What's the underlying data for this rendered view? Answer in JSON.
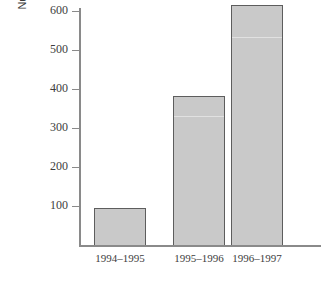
{
  "chart_data": {
    "type": "bar",
    "title": "",
    "subtitle": "",
    "xlabel": "",
    "ylabel": "Number of children in nursery school (per thousand)",
    "ylabel_line1": "Number of children in nursery school",
    "ylabel_line2": "(per thousand)",
    "categories": [
      "1994–1995",
      "1995–1996",
      "1996–1997"
    ],
    "values": [
      95,
      383,
      615
    ],
    "ylim": [
      0,
      650
    ],
    "yticks": [
      100,
      200,
      300,
      400,
      500,
      600
    ],
    "ytick_labels": [
      "100",
      "200",
      "300",
      "400",
      "500",
      "600"
    ],
    "grid": false,
    "legend": null,
    "legend_position": "none",
    "bar_fill_color": "#c9c9c9",
    "bar_border_color": "#5d5d5d",
    "axis_color": "#8a8a8a",
    "text_color": "#3d3d3d",
    "background_color": "#ffffff"
  }
}
